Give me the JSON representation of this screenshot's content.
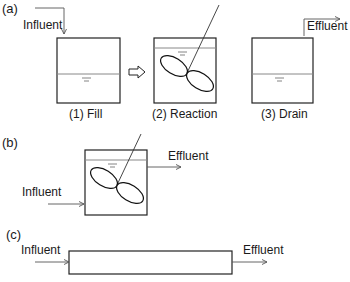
{
  "panels": {
    "a": {
      "label": "(a)",
      "influent_label": "Influent",
      "effluent_label": "Effluent",
      "steps": [
        {
          "label": "(1) Fill"
        },
        {
          "label": "(2) Reaction"
        },
        {
          "label": "(3) Drain"
        }
      ]
    },
    "b": {
      "label": "(b)",
      "influent_label": "Influent",
      "effluent_label": "Effluent"
    },
    "c": {
      "label": "(c)",
      "influent_label": "Influent",
      "effluent_label": "Effluent"
    }
  },
  "colors": {
    "line": "#222222",
    "water_line": "#888888",
    "flow_arrow": "#555555"
  }
}
